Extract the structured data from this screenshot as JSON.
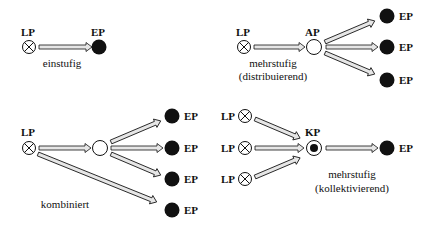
{
  "diagram": {
    "colors": {
      "ink": "#111111",
      "arrow_fill": "#e6e6e6",
      "background": "#ffffff"
    },
    "legend_terms": {
      "LP": "LP",
      "EP": "EP",
      "AP": "AP",
      "KP": "KP"
    },
    "panels": [
      {
        "id": "einstufig",
        "caption": [
          "einstufig"
        ],
        "nodes": [
          {
            "type": "LP",
            "label": "LP"
          },
          {
            "type": "EP",
            "label": "EP"
          }
        ]
      },
      {
        "id": "distribuierend",
        "caption": [
          "mehrstufig",
          "(distribuierend)"
        ],
        "nodes": [
          {
            "type": "LP",
            "label": "LP"
          },
          {
            "type": "AP",
            "label": "AP"
          },
          {
            "type": "EP",
            "label": "EP"
          },
          {
            "type": "EP",
            "label": "EP"
          },
          {
            "type": "EP",
            "label": "EP"
          }
        ]
      },
      {
        "id": "kombiniert",
        "caption": [
          "kombiniert"
        ],
        "nodes": [
          {
            "type": "LP",
            "label": "LP"
          },
          {
            "type": "AP",
            "label": ""
          },
          {
            "type": "EP",
            "label": "EP"
          },
          {
            "type": "EP",
            "label": "EP"
          },
          {
            "type": "EP",
            "label": "EP"
          },
          {
            "type": "EP",
            "label": "EP"
          }
        ]
      },
      {
        "id": "kollektivierend",
        "caption": [
          "mehrstufig",
          "(kollektivierend)"
        ],
        "nodes": [
          {
            "type": "LP",
            "label": "LP"
          },
          {
            "type": "LP",
            "label": "LP"
          },
          {
            "type": "LP",
            "label": "LP"
          },
          {
            "type": "KP",
            "label": "KP"
          },
          {
            "type": "EP",
            "label": "EP"
          }
        ]
      }
    ]
  }
}
